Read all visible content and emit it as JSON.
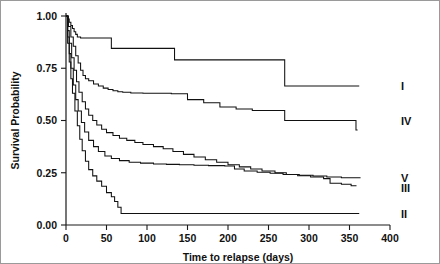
{
  "chart_data": {
    "type": "line",
    "title": "",
    "xlabel": "Time to relapse (days)",
    "ylabel": "Survival Probability",
    "xlim": [
      0,
      400
    ],
    "ylim": [
      0,
      1.0
    ],
    "xticks": [
      0,
      50,
      100,
      150,
      200,
      250,
      300,
      350,
      400
    ],
    "xticklabels": [
      "0",
      "50",
      "100",
      "150",
      "200",
      "250",
      "300",
      "350",
      "400"
    ],
    "yticks": [
      0.0,
      0.25,
      0.5,
      0.75,
      1.0
    ],
    "yticklabels": [
      "0.00",
      "0.25",
      "0.50",
      "0.75",
      "1.00"
    ],
    "grid": false,
    "legend_position": "right-inline",
    "step_style": "post",
    "series": [
      {
        "name": "I",
        "label": "I",
        "label_y": 0.665,
        "end_x": 362,
        "x": [
          0,
          2,
          4,
          6,
          8,
          10,
          12,
          14,
          18,
          50,
          56,
          128,
          134,
          264,
          270,
          362
        ],
        "y": [
          1.0,
          0.985,
          0.97,
          0.955,
          0.94,
          0.925,
          0.912,
          0.9,
          0.895,
          0.895,
          0.845,
          0.845,
          0.79,
          0.79,
          0.665,
          0.665
        ]
      },
      {
        "name": "IV",
        "label": "IV",
        "label_y": 0.5,
        "end_x": 360,
        "x": [
          0,
          3,
          6,
          9,
          12,
          15,
          18,
          21,
          24,
          28,
          34,
          40,
          46,
          52,
          58,
          64,
          70,
          80,
          95,
          130,
          150,
          170,
          190,
          210,
          230,
          264,
          270,
          352,
          358,
          360
        ],
        "y": [
          1.0,
          0.95,
          0.9,
          0.855,
          0.81,
          0.775,
          0.74,
          0.715,
          0.7,
          0.69,
          0.675,
          0.665,
          0.655,
          0.648,
          0.642,
          0.638,
          0.635,
          0.632,
          0.63,
          0.628,
          0.6,
          0.585,
          0.565,
          0.555,
          0.548,
          0.548,
          0.5,
          0.5,
          0.455,
          0.455
        ]
      },
      {
        "name": "V",
        "label": "V",
        "label_y": 0.225,
        "end_x": 363,
        "x": [
          0,
          2,
          4,
          7,
          10,
          13,
          16,
          20,
          24,
          28,
          33,
          38,
          44,
          50,
          58,
          66,
          75,
          85,
          95,
          108,
          120,
          132,
          145,
          158,
          172,
          186,
          200,
          214,
          228,
          242,
          258,
          272,
          288,
          305,
          322,
          340,
          363
        ],
        "y": [
          1.0,
          0.93,
          0.87,
          0.8,
          0.74,
          0.685,
          0.635,
          0.59,
          0.555,
          0.525,
          0.5,
          0.478,
          0.458,
          0.442,
          0.428,
          0.415,
          0.405,
          0.395,
          0.385,
          0.375,
          0.365,
          0.352,
          0.338,
          0.325,
          0.312,
          0.3,
          0.288,
          0.278,
          0.268,
          0.258,
          0.25,
          0.242,
          0.238,
          0.234,
          0.23,
          0.226,
          0.224
        ]
      },
      {
        "name": "III",
        "label": "III",
        "label_y": 0.175,
        "end_x": 358,
        "x": [
          0,
          2,
          4,
          6,
          9,
          12,
          15,
          19,
          23,
          28,
          34,
          40,
          48,
          56,
          66,
          78,
          92,
          108,
          124,
          140,
          158,
          176,
          196,
          208,
          220,
          236,
          252,
          268,
          286,
          302,
          318,
          326,
          340,
          352,
          358
        ],
        "y": [
          1.0,
          0.9,
          0.82,
          0.75,
          0.67,
          0.6,
          0.545,
          0.49,
          0.445,
          0.405,
          0.375,
          0.352,
          0.33,
          0.318,
          0.308,
          0.3,
          0.296,
          0.292,
          0.29,
          0.288,
          0.286,
          0.284,
          0.282,
          0.268,
          0.258,
          0.252,
          0.248,
          0.242,
          0.236,
          0.23,
          0.222,
          0.2,
          0.195,
          0.188,
          0.185
        ]
      },
      {
        "name": "II",
        "label": "II",
        "label_y": 0.055,
        "end_x": 362,
        "x": [
          0,
          2,
          4,
          6,
          8,
          11,
          14,
          17,
          20,
          24,
          28,
          33,
          38,
          44,
          50,
          56,
          60,
          64,
          68,
          362
        ],
        "y": [
          1.0,
          0.87,
          0.78,
          0.7,
          0.63,
          0.545,
          0.475,
          0.41,
          0.355,
          0.305,
          0.265,
          0.235,
          0.21,
          0.185,
          0.155,
          0.135,
          0.112,
          0.085,
          0.055,
          0.055
        ]
      }
    ]
  },
  "axes": {
    "x_axis_name": "time-axis",
    "y_axis_name": "probability-axis"
  }
}
